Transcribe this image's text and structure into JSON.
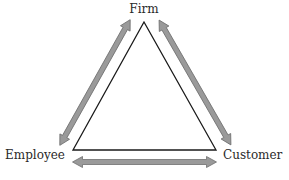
{
  "diagram": {
    "type": "triangle-relationship",
    "nodes": {
      "top": "Firm",
      "left": "Employee",
      "right": "Customer"
    },
    "relationships": [
      {
        "from": "Firm",
        "to": "Employee",
        "direction": "bidirectional"
      },
      {
        "from": "Firm",
        "to": "Customer",
        "direction": "bidirectional"
      },
      {
        "from": "Employee",
        "to": "Customer",
        "direction": "bidirectional"
      }
    ],
    "colors": {
      "triangle_stroke": "#1a1a1a",
      "arrow_fill": "#9a9a9a",
      "arrow_stroke": "#6f6f6f",
      "label_text": "#2a2a2a"
    }
  }
}
